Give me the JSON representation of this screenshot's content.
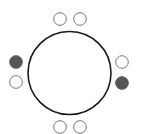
{
  "diagram": {
    "type": "round-table-seating",
    "colors": {
      "background": "#ffffff",
      "table_stroke": "#1a1a1a",
      "seat_stroke": "#777777",
      "seat_filled": "#555555",
      "seat_empty": "#ffffff"
    },
    "table": {
      "cx": 69.5,
      "cy": 73,
      "r": 41.5
    },
    "seats": [
      {
        "id": "top-left",
        "cx": 60,
        "cy": 19,
        "r": 6.3,
        "filled": false
      },
      {
        "id": "top-right",
        "cx": 80,
        "cy": 19,
        "r": 6.3,
        "filled": false
      },
      {
        "id": "left-upper",
        "cx": 16,
        "cy": 62,
        "r": 6.3,
        "filled": true
      },
      {
        "id": "left-lower",
        "cx": 16,
        "cy": 82,
        "r": 6.3,
        "filled": false
      },
      {
        "id": "right-upper",
        "cx": 122,
        "cy": 62,
        "r": 6.3,
        "filled": false
      },
      {
        "id": "right-lower",
        "cx": 122,
        "cy": 83,
        "r": 6.3,
        "filled": true
      },
      {
        "id": "bottom-left",
        "cx": 60,
        "cy": 127,
        "r": 6.3,
        "filled": false
      },
      {
        "id": "bottom-right",
        "cx": 80,
        "cy": 127,
        "r": 6.3,
        "filled": false
      }
    ],
    "summary": {
      "total_seats": 8,
      "filled_seats": 2,
      "empty_seats": 6
    }
  }
}
